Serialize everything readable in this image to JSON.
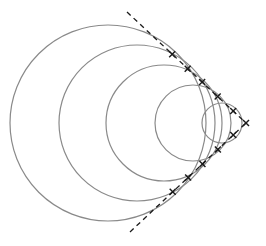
{
  "diagram": {
    "colors": {
      "background": "#ffffff",
      "circle_stroke": "#8a8a8a",
      "line_stroke": "#1a1a1a"
    },
    "vertex": {
      "x": 246,
      "y": 123
    },
    "tangent_lines": [
      {
        "name": "upper",
        "from": {
          "x": 127,
          "y": 12
        },
        "to": {
          "x": 246,
          "y": 123
        },
        "style": "dashed"
      },
      {
        "name": "lower",
        "from": {
          "x": 130,
          "y": 232
        },
        "to": {
          "x": 246,
          "y": 123
        },
        "style": "dashed"
      }
    ],
    "circles": [
      {
        "cx": 108,
        "cy": 123,
        "r": 98
      },
      {
        "cx": 137,
        "cy": 123,
        "r": 78
      },
      {
        "cx": 164,
        "cy": 123,
        "r": 58
      },
      {
        "cx": 193,
        "cy": 123,
        "r": 38
      },
      {
        "cx": 222,
        "cy": 123,
        "r": 20
      }
    ],
    "markers": "cross"
  }
}
